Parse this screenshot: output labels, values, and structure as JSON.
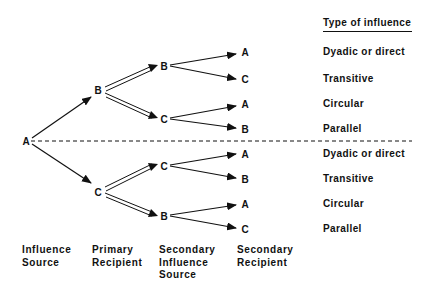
{
  "header": {
    "title": "Type of influence"
  },
  "nodes": {
    "source": "A",
    "primary_top": "B",
    "primary_bottom": "C",
    "secondary": [
      "B",
      "C",
      "C",
      "B"
    ],
    "leaves": [
      "A",
      "C",
      "A",
      "B",
      "A",
      "B",
      "A",
      "C"
    ]
  },
  "types": [
    "Dyadic or direct",
    "Transitive",
    "Circular",
    "Parallel",
    "Dyadic or direct",
    "Transitive",
    "Circular",
    "Parallel"
  ],
  "columns": {
    "c1": [
      "Influence",
      "Source"
    ],
    "c2": [
      "Primary",
      "Recipient"
    ],
    "c3": [
      "Secondary",
      "Influence",
      "Source"
    ],
    "c4": [
      "Secondary",
      "Recipient"
    ]
  }
}
